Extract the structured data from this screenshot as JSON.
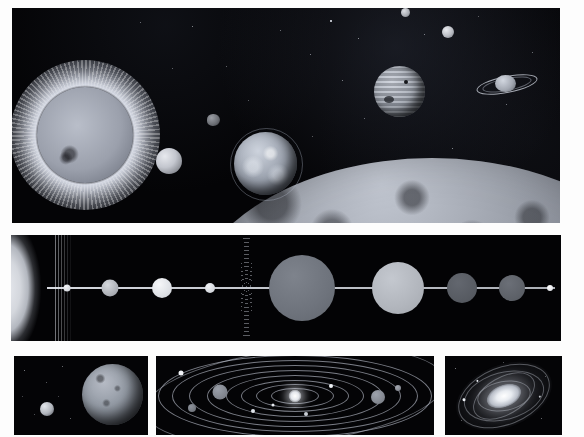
{
  "figure": {
    "background_color": "#fdfdfd",
    "space_color": "#040406",
    "width": 584,
    "height": 437
  },
  "panels": [
    {
      "id": "panel-top",
      "name": "space-scene",
      "caption": "Artist rendering of the Sun and planets in space",
      "objects": [
        {
          "name": "sun",
          "label": "Sun"
        },
        {
          "name": "mercury",
          "label": "Mercury"
        },
        {
          "name": "asteroid",
          "label": "Asteroid"
        },
        {
          "name": "earth",
          "label": "Earth"
        },
        {
          "name": "jupiter",
          "label": "Jupiter"
        },
        {
          "name": "saturn",
          "label": "Saturn"
        },
        {
          "name": "moon",
          "label": "Moon"
        },
        {
          "name": "foreground-planet",
          "label": "Cratered planet"
        }
      ]
    },
    {
      "id": "panel-mid",
      "name": "planet-size-comparison",
      "caption": "Relative sizes of the planets arranged in order from the Sun"
    },
    {
      "id": "panel-b1",
      "name": "pluto-charon-scene",
      "caption": "Pluto with its moon Charon"
    },
    {
      "id": "panel-b2",
      "name": "orbital-diagram",
      "caption": "Orbits of the planets around the Sun"
    },
    {
      "id": "panel-b3",
      "name": "spiral-galaxy",
      "caption": "Spiral galaxy seen at an oblique angle"
    }
  ],
  "chart_data": {
    "type": "scatter",
    "xlabel": "",
    "ylabel": "",
    "grid": false,
    "legend": null,
    "categories": [
      "Mercury",
      "Venus",
      "Earth",
      "Mars",
      "Asteroid Belt",
      "Jupiter",
      "Saturn",
      "Uranus",
      "Neptune",
      "Pluto"
    ],
    "series": [
      {
        "name": "Relative radius (px on plate)",
        "values": [
          3.5,
          8.5,
          10.0,
          5.0,
          0,
          33.0,
          26.0,
          15.0,
          13.0,
          3.0
        ]
      },
      {
        "name": "X position along axis (px)",
        "values": [
          56,
          99,
          151,
          199,
          229,
          291,
          387,
          451,
          501,
          539
        ]
      }
    ]
  },
  "orbital_diagram": {
    "type": "orbit-map",
    "center": "Sun",
    "orbit_count": 9,
    "planet_markers": [
      {
        "name": "mercury-marker",
        "size": 3
      },
      {
        "name": "venus-marker",
        "size": 4
      },
      {
        "name": "earth-marker",
        "size": 4
      },
      {
        "name": "mars-marker",
        "size": 4
      },
      {
        "name": "jupiter-marker",
        "size": 11
      },
      {
        "name": "saturn-marker",
        "size": 10
      },
      {
        "name": "uranus-marker",
        "size": 6
      },
      {
        "name": "neptune-marker",
        "size": 5
      },
      {
        "name": "pluto-marker",
        "size": 4
      }
    ]
  }
}
